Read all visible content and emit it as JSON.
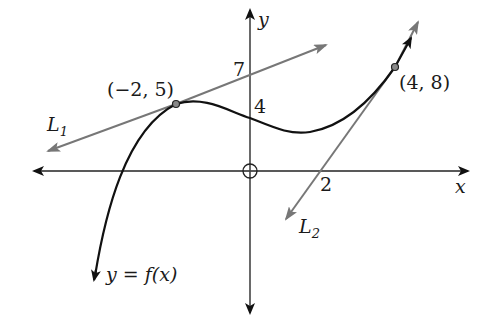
{
  "figure": {
    "axes": {
      "x_label": "x",
      "y_label": "y",
      "origin_marker": "circle-crosshair"
    },
    "tick_labels": {
      "y_7": "7",
      "y_4": "4",
      "x_2": "2"
    },
    "points": [
      {
        "label": "(−2, 5)",
        "x": -2,
        "y": 5
      },
      {
        "label": "(4, 8)",
        "x": 4,
        "y": 8
      }
    ],
    "lines": {
      "L1": {
        "label_main": "L",
        "label_sub": "1",
        "description": "tangent to f at (−2,5), y-intercept 7"
      },
      "L2": {
        "label_main": "L",
        "label_sub": "2",
        "description": "tangent to f at (4,8), x-intercept 2"
      }
    },
    "curve": {
      "label": "y = f(x)"
    },
    "colors": {
      "curve": "#111111",
      "axes": "#222222",
      "tangent_lines": "#777777",
      "point_fill": "#888888"
    }
  }
}
